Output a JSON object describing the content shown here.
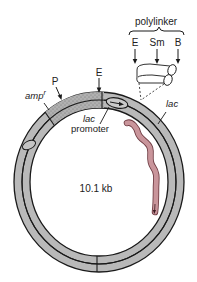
{
  "diagram": {
    "size_label": "10.1 kb",
    "polylinker": {
      "label": "polylinker",
      "sites": [
        {
          "label": "E"
        },
        {
          "label": "Sm"
        },
        {
          "label": "B"
        }
      ]
    },
    "sites": {
      "P": "P",
      "E": "E"
    },
    "genes": {
      "ampr_main": "amp",
      "ampr_sup": "r",
      "lac": "lac",
      "lac_promoter_line1": "lac",
      "lac_promoter_line2": "promoter"
    },
    "colors": {
      "ring_fill": "#b9b9b9",
      "ring_stroke": "#1a1a1a",
      "ampr_fill": "#a8a8a8",
      "transcript_fill": "#c9959b",
      "transcript_stroke": "#6e3b42",
      "text": "#222222"
    }
  }
}
